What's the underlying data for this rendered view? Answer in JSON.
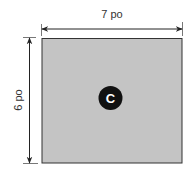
{
  "diagram": {
    "shape": "rectangle",
    "fill_color": "#c4c4c4",
    "width_label": "7 po",
    "height_label": "6 po",
    "center_marker": "C"
  }
}
